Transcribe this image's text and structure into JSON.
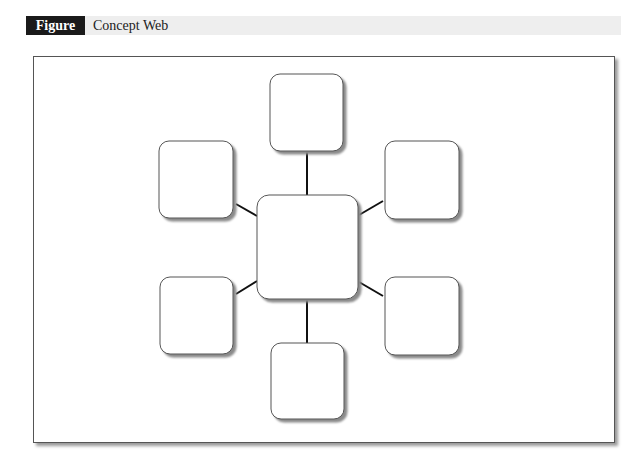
{
  "figure": {
    "label": "Figure 3.3",
    "title": "Concept Web"
  },
  "diagram": {
    "type": "concept-web",
    "center_node": {
      "id": "center",
      "text": "",
      "x": 257,
      "y": 195,
      "w": 101,
      "h": 104
    },
    "nodes": [
      {
        "id": "top",
        "text": "",
        "x": 270,
        "y": 74,
        "w": 73,
        "h": 77
      },
      {
        "id": "top-left",
        "text": "",
        "x": 159,
        "y": 141,
        "w": 74,
        "h": 77
      },
      {
        "id": "top-right",
        "text": "",
        "x": 385,
        "y": 141,
        "w": 74,
        "h": 78
      },
      {
        "id": "bottom-left",
        "text": "",
        "x": 160,
        "y": 277,
        "w": 73,
        "h": 77
      },
      {
        "id": "bottom-right",
        "text": "",
        "x": 385,
        "y": 277,
        "w": 74,
        "h": 78
      },
      {
        "id": "bottom",
        "text": "",
        "x": 271,
        "y": 343,
        "w": 73,
        "h": 76
      }
    ],
    "edges": [
      {
        "from": "center",
        "to": "top",
        "x1": 307,
        "y1": 195,
        "x2": 307,
        "y2": 151
      },
      {
        "from": "center",
        "to": "top-left",
        "x1": 257,
        "y1": 216,
        "x2": 236,
        "y2": 204
      },
      {
        "from": "center",
        "to": "top-right",
        "x1": 359,
        "y1": 215,
        "x2": 383,
        "y2": 201
      },
      {
        "from": "center",
        "to": "bottom-left",
        "x1": 257,
        "y1": 281,
        "x2": 236,
        "y2": 294
      },
      {
        "from": "center",
        "to": "bottom-right",
        "x1": 359,
        "y1": 282,
        "x2": 383,
        "y2": 296
      },
      {
        "from": "center",
        "to": "bottom",
        "x1": 307,
        "y1": 299,
        "x2": 307,
        "y2": 343
      }
    ],
    "colors": {
      "box_stroke": "#555555",
      "box_fill": "#ffffff",
      "shadow": "#999999",
      "edge": "#111111"
    }
  }
}
